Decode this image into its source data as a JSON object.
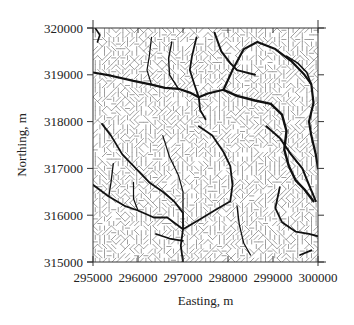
{
  "chart_data": {
    "type": "heatmap",
    "title": "",
    "subtitle": "Flow-direction grid with extracted drainage network",
    "xlabel": "Easting, m",
    "ylabel": "Northing, m",
    "xlim": [
      295000,
      300000
    ],
    "ylim": [
      315000,
      320000
    ],
    "x_ticks": [
      295000,
      296000,
      297000,
      298000,
      299000,
      300000
    ],
    "y_ticks": [
      315000,
      316000,
      317000,
      318000,
      319000,
      320000
    ],
    "x_tick_labels": [
      "295000",
      "296000",
      "297000",
      "298000",
      "299000",
      "300000"
    ],
    "y_tick_labels": [
      "315000",
      "316000",
      "317000",
      "318000",
      "319000",
      "320000"
    ],
    "grid": false,
    "legend": null,
    "background_pattern": "flow-direction hatching (vertical and diagonal short strokes)",
    "streams": [
      {
        "name": "main-west-channel",
        "weight": 2.2,
        "points": [
          [
            295000,
            319050
          ],
          [
            295400,
            318980
          ],
          [
            295900,
            318870
          ],
          [
            296300,
            318790
          ],
          [
            296600,
            318720
          ],
          [
            296900,
            318700
          ],
          [
            297150,
            318620
          ],
          [
            297350,
            318520
          ],
          [
            297550,
            318600
          ],
          [
            297900,
            318680
          ]
        ]
      },
      {
        "name": "west-trib-north-1",
        "weight": 1.2,
        "points": [
          [
            296300,
            319800
          ],
          [
            296250,
            319400
          ],
          [
            296200,
            319100
          ],
          [
            296300,
            318790
          ]
        ]
      },
      {
        "name": "west-trib-north-2",
        "weight": 1.4,
        "points": [
          [
            296750,
            319700
          ],
          [
            296680,
            319350
          ],
          [
            296700,
            319000
          ],
          [
            296900,
            318700
          ]
        ]
      },
      {
        "name": "west-trib-north-3",
        "weight": 1.8,
        "points": [
          [
            297300,
            319800
          ],
          [
            297200,
            319400
          ],
          [
            297150,
            319100
          ],
          [
            297250,
            318800
          ],
          [
            297350,
            318520
          ]
        ]
      },
      {
        "name": "central-outlet-south",
        "weight": 1.8,
        "points": [
          [
            297350,
            318520
          ],
          [
            297380,
            318250
          ],
          [
            297500,
            318050
          ]
        ]
      },
      {
        "name": "ne-trib-upper",
        "weight": 2.0,
        "points": [
          [
            297700,
            319900
          ],
          [
            297850,
            319500
          ],
          [
            298050,
            319250
          ],
          [
            298200,
            319100
          ],
          [
            298600,
            319000
          ]
        ]
      },
      {
        "name": "ne-large-channel",
        "weight": 2.4,
        "points": [
          [
            297900,
            318680
          ],
          [
            298200,
            318550
          ],
          [
            298600,
            318450
          ],
          [
            298950,
            318380
          ],
          [
            299200,
            318150
          ],
          [
            299300,
            317800
          ],
          [
            299250,
            317400
          ],
          [
            299350,
            317050
          ],
          [
            299500,
            316750
          ],
          [
            299700,
            316550
          ],
          [
            299900,
            316300
          ]
        ]
      },
      {
        "name": "ne-loop-north",
        "weight": 2.2,
        "points": [
          [
            297900,
            318680
          ],
          [
            298100,
            319100
          ],
          [
            298350,
            319550
          ],
          [
            298650,
            319700
          ],
          [
            299050,
            319550
          ],
          [
            299400,
            319300
          ],
          [
            299700,
            319000
          ],
          [
            299850,
            318800
          ],
          [
            299900,
            318400
          ],
          [
            299800,
            318000
          ],
          [
            299850,
            317700
          ],
          [
            299950,
            317300
          ],
          [
            300000,
            317000
          ]
        ]
      },
      {
        "name": "ne-right-trib",
        "weight": 1.6,
        "points": [
          [
            299300,
            319400
          ],
          [
            299550,
            319250
          ],
          [
            299750,
            319050
          ],
          [
            299850,
            318800
          ]
        ]
      },
      {
        "name": "se-channel",
        "weight": 2.0,
        "points": [
          [
            298850,
            317900
          ],
          [
            299150,
            317650
          ],
          [
            299400,
            317300
          ],
          [
            299650,
            317000
          ],
          [
            299800,
            316650
          ],
          [
            299950,
            316300
          ]
        ]
      },
      {
        "name": "se-lower-channel",
        "weight": 1.8,
        "points": [
          [
            299150,
            316600
          ],
          [
            299050,
            316150
          ],
          [
            299200,
            315850
          ],
          [
            299500,
            315650
          ],
          [
            299800,
            315600
          ],
          [
            300000,
            315550
          ]
        ]
      },
      {
        "name": "central-west-channel",
        "weight": 1.8,
        "points": [
          [
            295200,
            317950
          ],
          [
            295400,
            317700
          ],
          [
            295650,
            317300
          ],
          [
            295950,
            317000
          ],
          [
            296250,
            316700
          ],
          [
            296550,
            316500
          ],
          [
            296800,
            316300
          ],
          [
            297000,
            316050
          ],
          [
            297000,
            315700
          ],
          [
            296950,
            315350
          ],
          [
            297000,
            315000
          ]
        ]
      },
      {
        "name": "central-east-trib",
        "weight": 1.8,
        "points": [
          [
            297350,
            317900
          ],
          [
            297650,
            317700
          ],
          [
            297900,
            317350
          ],
          [
            298050,
            317050
          ],
          [
            298100,
            316650
          ],
          [
            298050,
            316300
          ],
          [
            297700,
            316100
          ],
          [
            297350,
            315900
          ],
          [
            297000,
            315700
          ]
        ]
      },
      {
        "name": "central-north-trib",
        "weight": 1.2,
        "points": [
          [
            296550,
            317700
          ],
          [
            296700,
            317250
          ],
          [
            296900,
            316850
          ],
          [
            297000,
            316500
          ],
          [
            297000,
            316050
          ]
        ]
      },
      {
        "name": "west-lower-channel",
        "weight": 1.8,
        "points": [
          [
            295000,
            316650
          ],
          [
            295350,
            316400
          ],
          [
            295700,
            316200
          ],
          [
            296000,
            316100
          ],
          [
            296350,
            315950
          ],
          [
            296650,
            315950
          ],
          [
            297000,
            315700
          ]
        ]
      },
      {
        "name": "west-edge-arc",
        "weight": 1.6,
        "points": [
          [
            295050,
            320000
          ],
          [
            295150,
            319850
          ],
          [
            295100,
            319700
          ]
        ]
      },
      {
        "name": "sw-stub",
        "weight": 1.6,
        "points": [
          [
            296400,
            315600
          ],
          [
            296700,
            315500
          ],
          [
            297000,
            315450
          ]
        ]
      },
      {
        "name": "south-central-trib",
        "weight": 1.3,
        "points": [
          [
            298200,
            316200
          ],
          [
            298250,
            315800
          ],
          [
            298350,
            315400
          ],
          [
            298500,
            315150
          ]
        ]
      },
      {
        "name": "lower-left-trib",
        "weight": 1.3,
        "points": [
          [
            295450,
            317100
          ],
          [
            295400,
            316700
          ],
          [
            295350,
            316400
          ]
        ]
      },
      {
        "name": "se-corner-stub",
        "weight": 1.8,
        "points": [
          [
            299600,
            315150
          ],
          [
            299850,
            315250
          ]
        ]
      },
      {
        "name": "west-mid-trib",
        "weight": 1.2,
        "points": [
          [
            295900,
            316700
          ],
          [
            295900,
            316350
          ],
          [
            296000,
            316100
          ]
        ]
      }
    ]
  }
}
